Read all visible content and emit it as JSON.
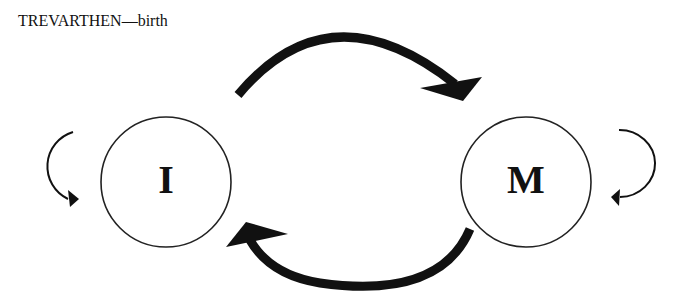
{
  "title": "TREVARTHEN—birth",
  "nodes": [
    {
      "id": "infant",
      "label": "I"
    },
    {
      "id": "mother",
      "label": "M"
    }
  ],
  "edges": [
    {
      "from": "I",
      "to": "M",
      "style": "thick-arc-top"
    },
    {
      "from": "M",
      "to": "I",
      "style": "thick-arc-bottom"
    },
    {
      "from": "I",
      "to": "I",
      "style": "thin-self-loop-left"
    },
    {
      "from": "M",
      "to": "M",
      "style": "thin-self-loop-right"
    }
  ],
  "colors": {
    "stroke": "#111111",
    "background": "#ffffff"
  }
}
